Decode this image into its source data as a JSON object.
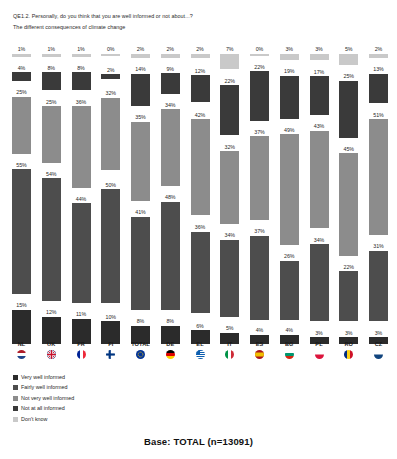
{
  "header": {
    "question": "QE1.2. Personally, do you think that you are well informed or not about...?",
    "subtitle": "The different consequences of climate change"
  },
  "base_note": "Base: TOTAL (n=13091)",
  "legend": {
    "items": [
      {
        "label": "Very well informed",
        "color": "#2b2b2b"
      },
      {
        "label": "Fairly well informed",
        "color": "#4d4d4d"
      },
      {
        "label": "Not very well informed",
        "color": "#8c8c8c"
      },
      {
        "label": "Not at all informed",
        "color": "#3a3a3a"
      },
      {
        "label": "Don't know",
        "color": "#c9c9c9"
      }
    ]
  },
  "flags": {
    "NL": "flag-icon-nl",
    "UK": "flag-icon-uk",
    "FR": "flag-icon-fr",
    "FI": "flag-icon-fi",
    "TOTAL": "flag-icon-total",
    "DE": "flag-icon-de",
    "EL": "flag-icon-el",
    "IT": "flag-icon-it",
    "ES": "flag-icon-es",
    "BG": "flag-icon-bg",
    "PL": "flag-icon-pl",
    "RO": "flag-icon-ro",
    "CZ": "flag-icon-cz"
  },
  "chart_data": {
    "type": "bar",
    "title": "QE1.2. Personally, do you think that you are well informed or not about...?",
    "subtitle": "The different consequences of climate change",
    "xlabel": "",
    "ylabel": "",
    "ylim": [
      0,
      100
    ],
    "grid": false,
    "legend_position": "bottom-left",
    "orientation": "vertical-grouped-stacked",
    "value_suffix": "%",
    "categories": [
      "NL",
      "UK",
      "FR",
      "FI",
      "TOTAL",
      "DE",
      "EL",
      "IT",
      "ES",
      "BG",
      "PL",
      "RO",
      "CZ"
    ],
    "series": [
      {
        "name": "Don't know",
        "color": "#c9c9c9",
        "values": [
          1,
          1,
          1,
          0,
          2,
          2,
          2,
          7,
          0,
          3,
          3,
          5,
          2
        ],
        "labels": [
          "1%",
          "1%",
          "1%",
          "0%",
          "2%",
          "2%",
          "2%",
          "7%",
          "0%",
          "3%",
          "3%",
          "5%",
          "2%"
        ]
      },
      {
        "name": "Not at all informed",
        "color": "#3a3a3a",
        "values": [
          4,
          8,
          8,
          2,
          14,
          9,
          12,
          22,
          22,
          19,
          17,
          25,
          13
        ],
        "labels": [
          "4%",
          "8%",
          "8%",
          "2%",
          "14%",
          "9%",
          "12%",
          "22%",
          "22%",
          "19%",
          "17%",
          "25%",
          "13%"
        ]
      },
      {
        "name": "Not very well informed",
        "color": "#8c8c8c",
        "values": [
          25,
          25,
          36,
          32,
          35,
          34,
          42,
          32,
          37,
          49,
          43,
          45,
          51
        ],
        "labels": [
          "25%",
          "25%",
          "36%",
          "32%",
          "35%",
          "34%",
          "42%",
          "32%",
          "37%",
          "49%",
          "43%",
          "45%",
          "51%"
        ]
      },
      {
        "name": "Fairly well informed",
        "color": "#4d4d4d",
        "values": [
          55,
          54,
          44,
          50,
          41,
          48,
          36,
          34,
          37,
          26,
          34,
          22,
          31
        ],
        "labels": [
          "55%",
          "54%",
          "44%",
          "50%",
          "41%",
          "48%",
          "36%",
          "34%",
          "37%",
          "26%",
          "34%",
          "22%",
          "31%"
        ]
      },
      {
        "name": "Very well informed",
        "color": "#2b2b2b",
        "values": [
          15,
          12,
          11,
          10,
          8,
          8,
          6,
          5,
          4,
          4,
          3,
          3,
          3
        ],
        "labels": [
          "15%",
          "12%",
          "11%",
          "10%",
          "8%",
          "8%",
          "6%",
          "5%",
          "4%",
          "4%",
          "3%",
          "3%",
          "3%"
        ]
      }
    ]
  }
}
